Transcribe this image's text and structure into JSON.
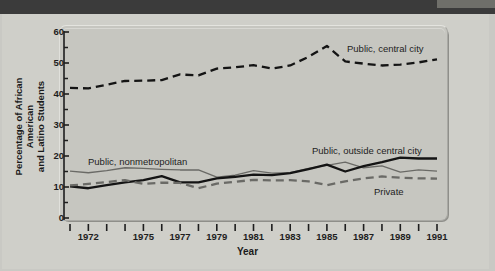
{
  "figure": {
    "ylabel_line1": "Percentage of African American",
    "ylabel_line2": "and Latino Students",
    "xlabel": "Year"
  },
  "colors": {
    "page_background": "#c9c9c4",
    "panel_background": "#c6c6c0",
    "header_bar": "#3b3b3b",
    "series_black": "#141414",
    "series_gray": "#6a6a66",
    "axis": "#1e1e1e"
  },
  "series_labels": {
    "public_central_city": "Public, central city",
    "public_nonmetropolitan": "Public, nonmetropolitan",
    "public_outside_central_city": "Public, outside central city",
    "private": "Private"
  },
  "axis": {
    "y_major_ticks": [
      "0",
      "10",
      "20",
      "30",
      "40",
      "50",
      "60"
    ],
    "y_minor_ticks": [
      "5",
      "15",
      "25",
      "35",
      "45",
      "55"
    ],
    "x_tick_labels": [
      "1972",
      "1975",
      "1977",
      "1979",
      "1981",
      "1983",
      "1985",
      "1987",
      "1989",
      "1991"
    ]
  },
  "chart_data": {
    "type": "line",
    "title": "",
    "xlabel": "Year",
    "ylabel": "Percentage of African American and Latino Students",
    "xlim": [
      1971,
      1991
    ],
    "ylim": [
      0,
      60
    ],
    "grid": false,
    "legend_position": "inline-annotations",
    "x": [
      1971,
      1972,
      1973,
      1974,
      1975,
      1976,
      1977,
      1978,
      1979,
      1980,
      1981,
      1982,
      1983,
      1984,
      1985,
      1986,
      1987,
      1988,
      1989,
      1990,
      1991
    ],
    "series": [
      {
        "name": "Public, central city",
        "style": "dashed",
        "color": "#141414",
        "width": "bold",
        "values": [
          42.0,
          41.8,
          43.0,
          44.2,
          44.3,
          44.5,
          46.3,
          46.0,
          48.2,
          48.6,
          49.3,
          48.2,
          49.2,
          52.0,
          55.5,
          50.5,
          49.8,
          49.2,
          49.5,
          50.2,
          51.2
        ]
      },
      {
        "name": "Public, nonmetropolitan",
        "style": "solid",
        "color": "#6a6a66",
        "width": "thin",
        "values": [
          15.1,
          14.6,
          15.3,
          16.2,
          16.0,
          15.7,
          15.5,
          15.5,
          13.2,
          13.8,
          15.3,
          14.5,
          14.6,
          16.0,
          17.0,
          18.0,
          16.2,
          16.8,
          14.8,
          15.5,
          15.1
        ]
      },
      {
        "name": "Public, outside central city",
        "style": "solid",
        "color": "#141414",
        "width": "bold",
        "values": [
          10.2,
          9.6,
          10.6,
          11.5,
          12.2,
          13.5,
          11.5,
          11.5,
          12.8,
          13.3,
          14.0,
          13.8,
          14.5,
          15.8,
          17.2,
          15.0,
          16.7,
          18.0,
          19.5,
          19.2,
          19.2
        ]
      },
      {
        "name": "Private",
        "style": "dashed",
        "color": "#6a6a66",
        "width": "bold",
        "values": [
          10.5,
          11.0,
          11.6,
          12.2,
          11.0,
          11.4,
          11.3,
          9.6,
          11.1,
          11.7,
          12.3,
          12.1,
          12.2,
          11.8,
          10.6,
          11.8,
          12.8,
          13.4,
          13.0,
          12.8,
          12.7
        ]
      }
    ]
  }
}
